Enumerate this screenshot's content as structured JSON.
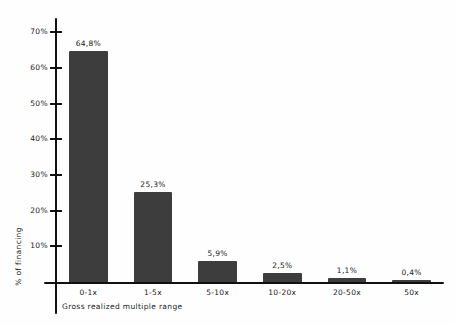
{
  "chart_data": {
    "type": "bar",
    "title": "",
    "xlabel": "Gross realized multiple range",
    "ylabel": "% of financing",
    "categories": [
      "0-1x",
      "1-5x",
      "5-10x",
      "10-20x",
      "20-50x",
      "50x"
    ],
    "values": [
      64.8,
      25.3,
      5.9,
      2.5,
      1.1,
      0.4
    ],
    "value_labels": [
      "64,8%",
      "25,3%",
      "5,9%",
      "2,5%",
      "1,1%",
      "0,4%"
    ],
    "ylim": [
      0,
      74
    ],
    "yticks": [
      10,
      20,
      30,
      40,
      50,
      60,
      70
    ],
    "ytick_labels": [
      "10%",
      "20%",
      "30%",
      "40%",
      "50%",
      "60%",
      "70%"
    ],
    "grid": false,
    "legend": false,
    "bar_color": "#3d3d3d",
    "axis_color": "#111111",
    "background_color": "#fefefe"
  }
}
